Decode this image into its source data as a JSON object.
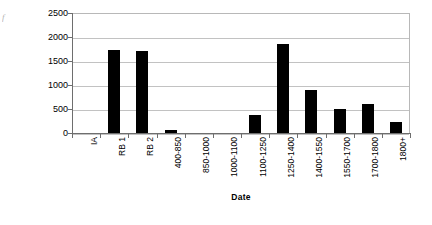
{
  "figure": {
    "artifact_glyph": "f",
    "background": "#ffffff",
    "bar_color": "#000000",
    "gridline_color": "#c2c2c2",
    "axis_color": "#6e6e6e"
  },
  "chart_data": {
    "type": "bar",
    "title": "",
    "subtitle": "",
    "xlabel": "Date",
    "ylabel": "No. of Sherds",
    "categories": [
      "IA",
      "RB 1",
      "RB 2",
      "400-850",
      "850-1000",
      "1000-1100",
      "1100-1250",
      "1250-1400",
      "1400-1550",
      "1550-1700",
      "1700-1800",
      "1800+"
    ],
    "values": [
      0,
      1730,
      1715,
      60,
      0,
      0,
      380,
      1860,
      890,
      510,
      600,
      235
    ],
    "ylim": [
      0,
      2500
    ],
    "yticks": [
      0,
      500,
      1000,
      1500,
      2000,
      2500
    ],
    "ytick_labels": [
      "0",
      "500",
      "1000",
      "1500",
      "2000",
      "2500"
    ],
    "grid": true,
    "grid_axis": "y",
    "legend": false,
    "legend_position": "none",
    "orientation": "vertical",
    "xtick_label_rotation": 90
  }
}
